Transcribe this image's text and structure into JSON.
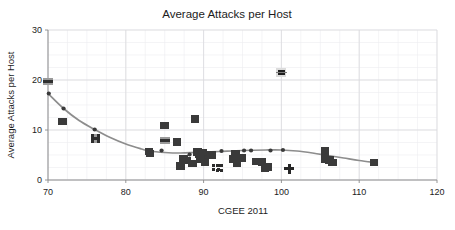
{
  "chart_data": {
    "type": "scatter",
    "title": "Average Attacks per Host",
    "xlabel": "CGEE 2011",
    "ylabel": "Average Attacks per Host",
    "xlim": [
      70,
      120
    ],
    "ylim": [
      0,
      30
    ],
    "xticks": [
      70,
      80,
      90,
      100,
      110,
      120
    ],
    "yticks": [
      0,
      10,
      20,
      30
    ],
    "xtick_labels": [
      "70",
      "80",
      "90",
      "100",
      "110",
      "120"
    ],
    "ytick_labels": [
      "0",
      "10",
      "20",
      "30"
    ],
    "grid": true,
    "grid_minor": true,
    "legend": "none",
    "marker_color": "#3a3a3a",
    "trend_color": "#8d8d8d",
    "series": [
      {
        "name": "Hosts",
        "marker": "square",
        "points": [
          {
            "x": 70.0,
            "y": 19.7,
            "marker": "bar"
          },
          {
            "x": 70.1,
            "y": 17.3,
            "marker": "dot"
          },
          {
            "x": 72.0,
            "y": 14.3,
            "marker": "dot"
          },
          {
            "x": 71.9,
            "y": 11.7,
            "marker": "square"
          },
          {
            "x": 76.0,
            "y": 10.1,
            "marker": "dot"
          },
          {
            "x": 76.1,
            "y": 8.3,
            "marker": "square-h"
          },
          {
            "x": 83.0,
            "y": 5.7,
            "marker": "square"
          },
          {
            "x": 83.1,
            "y": 5.3,
            "marker": "square"
          },
          {
            "x": 84.6,
            "y": 5.9,
            "marker": "dot"
          },
          {
            "x": 85.0,
            "y": 10.9,
            "marker": "square"
          },
          {
            "x": 85.1,
            "y": 7.9,
            "marker": "bar"
          },
          {
            "x": 86.6,
            "y": 7.6,
            "marker": "square"
          },
          {
            "x": 87.0,
            "y": 2.8,
            "marker": "square"
          },
          {
            "x": 87.4,
            "y": 4.3,
            "marker": "square"
          },
          {
            "x": 87.8,
            "y": 3.9,
            "marker": "square"
          },
          {
            "x": 88.2,
            "y": 5.1,
            "marker": "dot"
          },
          {
            "x": 88.6,
            "y": 3.3,
            "marker": "square"
          },
          {
            "x": 88.9,
            "y": 12.2,
            "marker": "square"
          },
          {
            "x": 89.2,
            "y": 5.6,
            "marker": "square"
          },
          {
            "x": 89.5,
            "y": 5.2,
            "marker": "square"
          },
          {
            "x": 89.6,
            "y": 4.2,
            "marker": "square"
          },
          {
            "x": 89.9,
            "y": 5.5,
            "marker": "square"
          },
          {
            "x": 90.2,
            "y": 3.6,
            "marker": "square"
          },
          {
            "x": 90.4,
            "y": 4.6,
            "marker": "dot"
          },
          {
            "x": 91.0,
            "y": 5.0,
            "marker": "square"
          },
          {
            "x": 91.6,
            "y": 2.5,
            "marker": "square-sm"
          },
          {
            "x": 92.0,
            "y": 2.4,
            "marker": "square-sm"
          },
          {
            "x": 92.3,
            "y": 5.8,
            "marker": "dot"
          },
          {
            "x": 93.8,
            "y": 4.2,
            "marker": "square"
          },
          {
            "x": 94.1,
            "y": 5.3,
            "marker": "square"
          },
          {
            "x": 94.3,
            "y": 3.3,
            "marker": "square"
          },
          {
            "x": 94.9,
            "y": 4.4,
            "marker": "square"
          },
          {
            "x": 95.2,
            "y": 5.9,
            "marker": "dot"
          },
          {
            "x": 96.1,
            "y": 5.9,
            "marker": "dot"
          },
          {
            "x": 96.8,
            "y": 3.7,
            "marker": "square"
          },
          {
            "x": 97.5,
            "y": 3.6,
            "marker": "square"
          },
          {
            "x": 97.9,
            "y": 2.4,
            "marker": "square"
          },
          {
            "x": 98.3,
            "y": 2.6,
            "marker": "square"
          },
          {
            "x": 98.6,
            "y": 5.9,
            "marker": "dot"
          },
          {
            "x": 100.0,
            "y": 21.5,
            "marker": "outlier"
          },
          {
            "x": 100.2,
            "y": 6.0,
            "marker": "dot"
          },
          {
            "x": 101.0,
            "y": 2.3,
            "marker": "plus"
          },
          {
            "x": 105.6,
            "y": 5.8,
            "marker": "square"
          },
          {
            "x": 105.8,
            "y": 4.9,
            "marker": "dot"
          },
          {
            "x": 105.6,
            "y": 4.2,
            "marker": "square"
          },
          {
            "x": 106.2,
            "y": 4.0,
            "marker": "square"
          },
          {
            "x": 106.6,
            "y": 3.5,
            "marker": "square"
          },
          {
            "x": 111.9,
            "y": 3.5,
            "marker": "square"
          }
        ]
      }
    ],
    "trend": {
      "name": "fitted curve",
      "points": [
        {
          "x": 70.0,
          "y": 17.3
        },
        {
          "x": 72.0,
          "y": 14.3
        },
        {
          "x": 74.0,
          "y": 11.9
        },
        {
          "x": 76.0,
          "y": 10.1
        },
        {
          "x": 78.0,
          "y": 8.5
        },
        {
          "x": 80.0,
          "y": 7.2
        },
        {
          "x": 82.0,
          "y": 6.2
        },
        {
          "x": 83.0,
          "y": 5.8
        },
        {
          "x": 85.0,
          "y": 5.5
        },
        {
          "x": 87.0,
          "y": 5.4
        },
        {
          "x": 89.0,
          "y": 5.5
        },
        {
          "x": 92.0,
          "y": 5.7
        },
        {
          "x": 95.0,
          "y": 5.9
        },
        {
          "x": 98.0,
          "y": 6.0
        },
        {
          "x": 100.0,
          "y": 6.0
        },
        {
          "x": 102.0,
          "y": 5.8
        },
        {
          "x": 104.0,
          "y": 5.4
        },
        {
          "x": 106.0,
          "y": 4.9
        },
        {
          "x": 108.0,
          "y": 4.4
        },
        {
          "x": 110.0,
          "y": 3.9
        },
        {
          "x": 112.0,
          "y": 3.5
        }
      ]
    }
  }
}
